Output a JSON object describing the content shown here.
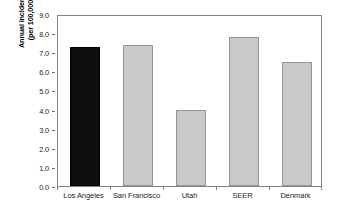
{
  "chart_data": {
    "type": "bar",
    "title": "",
    "xlabel": "",
    "ylabel_line1": "Annual incidence",
    "ylabel_line2": "(per 100,000)",
    "categories": [
      "Los Angeles",
      "San Francisco",
      "Utah",
      "SEER",
      "Denmark"
    ],
    "values": [
      7.25,
      7.4,
      4.0,
      7.8,
      6.5
    ],
    "ylim": [
      0.0,
      9.0
    ],
    "ytick_values": [
      0.0,
      1.0,
      2.0,
      3.0,
      4.0,
      5.0,
      6.0,
      7.0,
      8.0,
      9.0
    ],
    "ytick_labels": [
      "0.0",
      "1.0",
      "2.0",
      "3.0",
      "4.0",
      "5.0",
      "6.0",
      "7.0",
      "8.0",
      "9.0"
    ],
    "grid": false,
    "legend": "none",
    "bar_colors": [
      "#100d0d",
      "#c9c9c9",
      "#c9c9c9",
      "#c9c9c9",
      "#c9c9c9"
    ],
    "bar_border_colors": [
      "#000000",
      "#939598",
      "#939598",
      "#939598",
      "#939598"
    ],
    "highlighted_category": "Los Angeles",
    "frame_color": "#808285",
    "background_color": "#ffffff"
  }
}
